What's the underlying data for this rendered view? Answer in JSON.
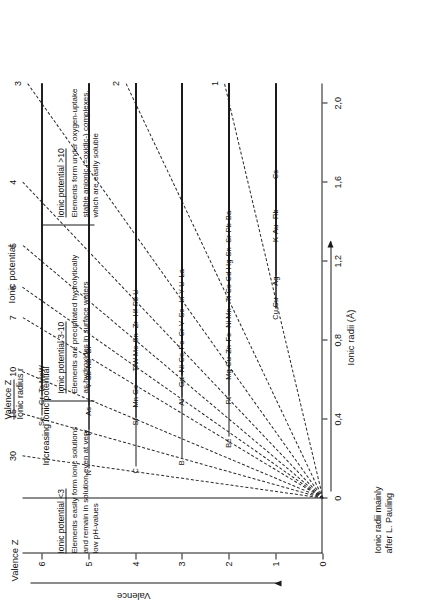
{
  "figure": {
    "title": "Ionic potential",
    "legend": {
      "line1": "Valence Z",
      "line2": "Ionic radius r"
    },
    "credit": "Ionic radii mainly\nafter L. Pauling",
    "increasing_label": "Increasing ionic potential"
  },
  "axes": {
    "x": {
      "label": "Ionic radii (Å)",
      "ticks": [
        "0",
        "0,4",
        "0,8",
        "1,2",
        "1,6",
        "2,0"
      ],
      "tick_values": [
        0,
        0.4,
        0.8,
        1.2,
        1.6,
        2.0
      ],
      "min": -0.28,
      "max": 2.1
    },
    "y": {
      "label": "Valence",
      "axis_name": "Valence Z",
      "ticks": [
        "0",
        "1",
        "2",
        "3",
        "4",
        "5",
        "6"
      ],
      "tick_values": [
        0,
        1,
        2,
        3,
        4,
        5,
        6
      ],
      "min": 0,
      "max": 6.4
    }
  },
  "ionic_potential_scale": {
    "title": "Ionic potential",
    "values": [
      1,
      2,
      3,
      4,
      5,
      6,
      7,
      10,
      15,
      30
    ],
    "labels": [
      "1",
      "2",
      "3",
      "4",
      "5",
      "6",
      "7",
      "10",
      "15",
      "30"
    ]
  },
  "zones": [
    {
      "header": "Ionic potential <3",
      "body": "Elements easily form ionic solutions\nand remain in solution even at very\nlow pH-values"
    },
    {
      "header": "Ionic potential 3-10",
      "body": "Elements are precipitated hydrolytically\nas hydroxides in surface waters"
    },
    {
      "header": "Ionic potential >10",
      "body": "Elements form under oxygen-uptake\nstable anionic (=oxidic-) complexes,\nwhich are easily soluble"
    }
  ],
  "chart_data": {
    "type": "scatter",
    "title": "Ionic potential",
    "xlabel": "Ionic radii (Å)",
    "ylabel": "Valence",
    "xlim": [
      -0.28,
      2.1
    ],
    "ylim": [
      0,
      6.4
    ],
    "grid": false,
    "legend_position": "top-center",
    "isolines": [
      {
        "value": 1,
        "label": "1"
      },
      {
        "value": 2,
        "label": "2"
      },
      {
        "value": 3,
        "label": "3"
      },
      {
        "value": 4,
        "label": "4"
      },
      {
        "value": 5,
        "label": "5"
      },
      {
        "value": 6,
        "label": "6"
      },
      {
        "value": 7,
        "label": "7"
      },
      {
        "value": 10,
        "label": "10"
      },
      {
        "value": 15,
        "label": "15"
      },
      {
        "value": 30,
        "label": "30"
      }
    ],
    "points": [
      {
        "label": "N",
        "valence": 5,
        "radius": 0.15
      },
      {
        "label": "C",
        "valence": 4,
        "radius": 0.16
      },
      {
        "label": "B",
        "valence": 3,
        "radius": 0.2
      },
      {
        "label": "P",
        "valence": 5,
        "radius": 0.35
      },
      {
        "label": "Te",
        "valence": 6,
        "radius": 0.56
      },
      {
        "label": "Cr",
        "valence": 6,
        "radius": 0.52
      },
      {
        "label": "Se",
        "valence": 6,
        "radius": 0.42
      },
      {
        "label": "As",
        "valence": 5,
        "radius": 0.47
      },
      {
        "label": "Si",
        "valence": 4,
        "radius": 0.41
      },
      {
        "label": "Mo",
        "valence": 6,
        "radius": 0.62
      },
      {
        "label": "W",
        "valence": 6,
        "radius": 0.68
      },
      {
        "label": "V",
        "valence": 5,
        "radius": 0.59
      },
      {
        "label": "Sb",
        "valence": 5,
        "radius": 0.62
      },
      {
        "label": "Nb",
        "valence": 5,
        "radius": 0.69
      },
      {
        "label": "Bi",
        "valence": 5,
        "radius": 0.74
      },
      {
        "label": "Mn",
        "valence": 4,
        "radius": 0.52
      },
      {
        "label": "Ge",
        "valence": 4,
        "radius": 0.53
      },
      {
        "label": "W",
        "valence": 4,
        "radius": 0.7
      },
      {
        "label": "Be",
        "valence": 2,
        "radius": 0.31
      },
      {
        "label": "Al",
        "valence": 3,
        "radius": 0.51
      },
      {
        "label": "Ti",
        "valence": 4,
        "radius": 0.68
      },
      {
        "label": "Sn",
        "valence": 4,
        "radius": 0.71
      },
      {
        "label": "Mo",
        "valence": 4,
        "radius": 0.7
      },
      {
        "label": "Zr",
        "valence": 4,
        "radius": 0.79
      },
      {
        "label": "Hf",
        "valence": 4,
        "radius": 0.81
      },
      {
        "label": "Pb",
        "valence": 4,
        "radius": 0.84
      },
      {
        "label": "Ga",
        "valence": 3,
        "radius": 0.62
      },
      {
        "label": "Ni",
        "valence": 3,
        "radius": 0.62
      },
      {
        "label": "Fe",
        "valence": 3,
        "radius": 0.64
      },
      {
        "label": "Co",
        "valence": 3,
        "radius": 0.63
      },
      {
        "label": "U",
        "valence": 4,
        "radius": 0.97
      },
      {
        "label": "Cr",
        "valence": 3,
        "radius": 0.69
      },
      {
        "label": "V",
        "valence": 3,
        "radius": 0.74
      },
      {
        "label": "Sc",
        "valence": 3,
        "radius": 0.81
      },
      {
        "label": "In",
        "valence": 3,
        "radius": 0.81
      },
      {
        "label": "Pt",
        "valence": 2,
        "radius": 0.52
      },
      {
        "label": "Y",
        "valence": 3,
        "radius": 0.92
      },
      {
        "label": "Mg",
        "valence": 2,
        "radius": 0.66
      },
      {
        "label": "Cu",
        "valence": 2,
        "radius": 0.72
      },
      {
        "label": "Zn",
        "valence": 2,
        "radius": 0.74
      },
      {
        "label": "Fe",
        "valence": 2,
        "radius": 0.76
      },
      {
        "label": "Ni",
        "valence": 2,
        "radius": 0.78
      },
      {
        "label": "Mn",
        "valence": 2,
        "radius": 0.8
      },
      {
        "label": "Ti",
        "valence": 2,
        "radius": 0.82
      },
      {
        "label": "Cd",
        "valence": 2,
        "radius": 0.84
      },
      {
        "label": "Co",
        "valence": 2,
        "radius": 0.82
      },
      {
        "label": "Cu",
        "valence": 1,
        "radius": 0.96
      },
      {
        "label": "La",
        "valence": 3,
        "radius": 1.14
      },
      {
        "label": "U",
        "valence": 3,
        "radius": 1.05
      },
      {
        "label": "Hg",
        "valence": 2,
        "radius": 0.93
      },
      {
        "label": "Sn",
        "valence": 2,
        "radius": 0.96
      },
      {
        "label": "Sr",
        "valence": 2,
        "radius": 1.12
      },
      {
        "label": "Pb",
        "valence": 2,
        "radius": 1.2
      },
      {
        "label": "Ba",
        "valence": 2,
        "radius": 1.34
      },
      {
        "label": "Cu",
        "valence": 1,
        "radius": 0.96
      },
      {
        "label": "Ag",
        "valence": 1,
        "radius": 1.13
      },
      {
        "label": "K",
        "valence": 1,
        "radius": 1.33
      },
      {
        "label": "Au",
        "valence": 1,
        "radius": 1.37
      },
      {
        "label": "Rb",
        "valence": 1,
        "radius": 1.47
      },
      {
        "label": "Cs",
        "valence": 1,
        "radius": 1.67
      }
    ]
  }
}
